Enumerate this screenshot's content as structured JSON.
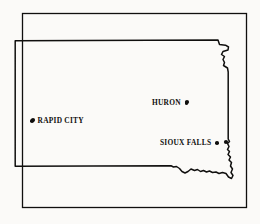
{
  "figure": {
    "background_color": "#fbfaf8",
    "line_color": "#100f0e"
  },
  "frame": {
    "name": "outer-border-rectangle",
    "x": 22,
    "y": 13,
    "width": 225,
    "height": 195
  },
  "state_outline": {
    "name": "south-dakota-state-boundary",
    "stroke_color": "#100f0e",
    "stroke_width": 1.4,
    "fill": "none"
  },
  "cities": [
    {
      "name": "rapid-city",
      "label": "RAPID CITY",
      "dot_side": "left",
      "dot_x": 33,
      "dot_y": 120
    },
    {
      "name": "huron",
      "label": "HURON",
      "dot_side": "right",
      "dot_x": 187,
      "dot_y": 102
    },
    {
      "name": "sioux-falls",
      "label": "SIOUX FALLS",
      "dot_side": "right",
      "dot_x": 226,
      "dot_y": 142
    }
  ]
}
